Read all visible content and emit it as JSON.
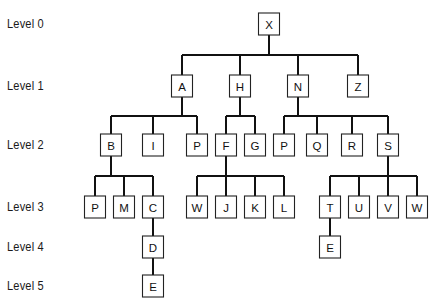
{
  "diagram": {
    "type": "tree",
    "box": {
      "width": 21,
      "height": 22
    },
    "colors": {
      "line": "#111111",
      "box_border": "#222222",
      "background": "#ffffff",
      "text": "#111111"
    },
    "levels": [
      {
        "label": "Level 0",
        "y": 24
      },
      {
        "label": "Level 1",
        "y": 86
      },
      {
        "label": "Level 2",
        "y": 145
      },
      {
        "label": "Level 3",
        "y": 207
      },
      {
        "label": "Level 4",
        "y": 247
      },
      {
        "label": "Level 5",
        "y": 286
      }
    ],
    "nodes": [
      {
        "id": "X",
        "label": "X",
        "level": 0,
        "x": 269,
        "parent": null
      },
      {
        "id": "A",
        "label": "A",
        "level": 1,
        "x": 182,
        "parent": "X"
      },
      {
        "id": "H",
        "label": "H",
        "level": 1,
        "x": 240,
        "parent": "X"
      },
      {
        "id": "N",
        "label": "N",
        "level": 1,
        "x": 298,
        "parent": "X"
      },
      {
        "id": "Z",
        "label": "Z",
        "level": 1,
        "x": 358,
        "parent": "X"
      },
      {
        "id": "B",
        "label": "B",
        "level": 2,
        "x": 111,
        "parent": "A"
      },
      {
        "id": "I",
        "label": "I",
        "level": 2,
        "x": 153,
        "parent": "A"
      },
      {
        "id": "P1",
        "label": "P",
        "level": 2,
        "x": 197,
        "parent": "A"
      },
      {
        "id": "F",
        "label": "F",
        "level": 2,
        "x": 226,
        "parent": "H"
      },
      {
        "id": "G",
        "label": "G",
        "level": 2,
        "x": 255,
        "parent": "H"
      },
      {
        "id": "P2",
        "label": "P",
        "level": 2,
        "x": 284,
        "parent": "N"
      },
      {
        "id": "Q",
        "label": "Q",
        "level": 2,
        "x": 317,
        "parent": "N"
      },
      {
        "id": "R",
        "label": "R",
        "level": 2,
        "x": 352,
        "parent": "N"
      },
      {
        "id": "S",
        "label": "S",
        "level": 2,
        "x": 388,
        "parent": "N"
      },
      {
        "id": "P3",
        "label": "P",
        "level": 3,
        "x": 95,
        "parent": "B"
      },
      {
        "id": "M",
        "label": "M",
        "level": 3,
        "x": 124,
        "parent": "B"
      },
      {
        "id": "C",
        "label": "C",
        "level": 3,
        "x": 153,
        "parent": "B"
      },
      {
        "id": "W1",
        "label": "W",
        "level": 3,
        "x": 197,
        "parent": "F"
      },
      {
        "id": "J",
        "label": "J",
        "level": 3,
        "x": 226,
        "parent": "F"
      },
      {
        "id": "K",
        "label": "K",
        "level": 3,
        "x": 255,
        "parent": "F"
      },
      {
        "id": "L",
        "label": "L",
        "level": 3,
        "x": 284,
        "parent": "F"
      },
      {
        "id": "T",
        "label": "T",
        "level": 3,
        "x": 330,
        "parent": "S"
      },
      {
        "id": "U",
        "label": "U",
        "level": 3,
        "x": 359,
        "parent": "S"
      },
      {
        "id": "V",
        "label": "V",
        "level": 3,
        "x": 388,
        "parent": "S"
      },
      {
        "id": "W2",
        "label": "W",
        "level": 3,
        "x": 417,
        "parent": "S"
      },
      {
        "id": "D",
        "label": "D",
        "level": 4,
        "x": 153,
        "parent": "C"
      },
      {
        "id": "E1",
        "label": "E",
        "level": 4,
        "x": 330,
        "parent": "T"
      },
      {
        "id": "E2",
        "label": "E",
        "level": 5,
        "x": 153,
        "parent": "D"
      }
    ]
  }
}
